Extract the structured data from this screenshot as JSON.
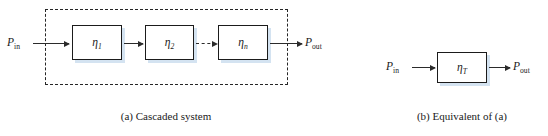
{
  "figure": {
    "panels": [
      {
        "id": "a",
        "caption": "(a) Cascaded system",
        "input_label": "P",
        "input_sub": "in",
        "output_label": "P",
        "output_sub": "out",
        "group_border_style": "dashed",
        "blocks": [
          {
            "symbol": "η",
            "subscript": "1"
          },
          {
            "symbol": "η",
            "subscript": "2"
          },
          {
            "symbol": "η",
            "subscript": "n"
          }
        ],
        "connectors": [
          {
            "from": "input",
            "to": "block-1",
            "style": "solid",
            "arrowhead": true
          },
          {
            "from": "block-1",
            "to": "block-2",
            "style": "solid",
            "arrowhead": true
          },
          {
            "from": "block-2",
            "to": "block-3",
            "style": "dashed",
            "arrowhead": true
          },
          {
            "from": "block-3",
            "to": "output",
            "style": "solid",
            "arrowhead": true
          }
        ]
      },
      {
        "id": "b",
        "caption": "(b) Equivalent of (a)",
        "input_label": "P",
        "input_sub": "in",
        "output_label": "P",
        "output_sub": "out",
        "group_border_style": "none",
        "blocks": [
          {
            "symbol": "η",
            "subscript": "T"
          }
        ],
        "connectors": [
          {
            "from": "input",
            "to": "block-1",
            "style": "solid",
            "arrowhead": true
          },
          {
            "from": "block-1",
            "to": "output",
            "style": "solid",
            "arrowhead": true
          }
        ]
      }
    ],
    "colors": {
      "stroke": "#1b1b1b",
      "arrow": "#2b2b2b",
      "box_fill": "#ffffff",
      "box_shadow": "#cddeee",
      "background": "#ffffff",
      "text": "#1a1a1a"
    }
  }
}
